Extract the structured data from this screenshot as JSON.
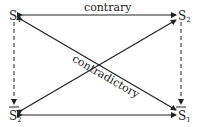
{
  "diagram": {
    "type": "square of opposition",
    "nodes": {
      "top_left": {
        "letter": "S",
        "sub": "1",
        "overbar": false
      },
      "top_right": {
        "letter": "S",
        "sub": "2",
        "overbar": false
      },
      "bottom_left": {
        "letter": "S",
        "sub": "2",
        "overbar": true
      },
      "bottom_right": {
        "letter": "S",
        "sub": "1",
        "overbar": true
      }
    },
    "edges": {
      "top": "contrary",
      "diagonal": "contradictory"
    },
    "colors": {
      "line": "#222222",
      "background": "#ffffff"
    }
  }
}
